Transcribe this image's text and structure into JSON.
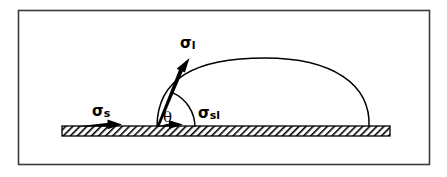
{
  "figure": {
    "background_color": "#ffffff",
    "frame": {
      "border_color": "#3a3a40",
      "x": 18,
      "y": 10,
      "width": 412,
      "height": 155
    },
    "labels": {
      "sigma_s": {
        "symbol": "σ",
        "subscript": "s",
        "full": "σs",
        "x": 96,
        "y": 114
      },
      "sigma_l": {
        "symbol": "σ",
        "subscript": "l",
        "full": "σl",
        "x": 183,
        "y": 47
      },
      "sigma_sl": {
        "symbol": "σ",
        "subscript": "sl",
        "full": "σsl",
        "x": 203,
        "y": 117
      },
      "theta": {
        "symbol": "θ",
        "full": "θ",
        "x": 168,
        "y": 121
      }
    },
    "substrate": {
      "name": "solid-substrate",
      "x": 62,
      "y": 126,
      "width": 328,
      "height": 10,
      "fill_color": "#000000",
      "hatch_pattern": "diagonal-hatch"
    },
    "droplet": {
      "name": "liquid-droplet",
      "contact_point_left_x": 157,
      "contact_point_right_x": 369,
      "baseline_y": 127,
      "apex_x": 265,
      "apex_y": 60,
      "stroke_color": "#000000"
    },
    "vectors": {
      "sigma_l_vector": {
        "x1": 157,
        "y1": 127,
        "x2": 187,
        "y2": 60,
        "style": "tapered-arrow",
        "color": "#000000"
      },
      "sigma_s_vector": {
        "x1": 76,
        "y1": 125,
        "x2": 120,
        "y2": 125,
        "style": "tapered-arrow",
        "color": "#000000"
      },
      "sigma_sl_vector": {
        "x1": 157,
        "y1": 125,
        "x2": 182,
        "y2": 125,
        "style": "tapered-arrow",
        "color": "#000000"
      }
    },
    "angle_arc": {
      "name": "contact-angle-arc",
      "center_x": 157,
      "center_y": 127,
      "radius": 38,
      "start_angle_deg": 0,
      "end_angle_deg": 66,
      "color": "#000000"
    }
  }
}
